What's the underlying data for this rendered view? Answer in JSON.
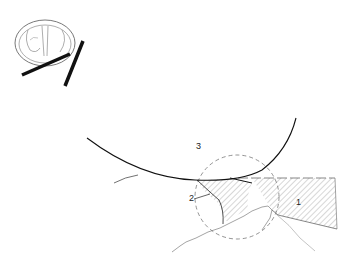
{
  "figure": {
    "inset": {
      "description": "cross-section orientation sketch with two bars indicating cut planes"
    },
    "labels": [
      {
        "id": "1",
        "text": "1",
        "x": 296,
        "y": 205
      },
      {
        "id": "2",
        "text": "2",
        "x": 199,
        "y": 200
      },
      {
        "id": "3",
        "text": "3",
        "x": 196,
        "y": 149
      }
    ],
    "colors": {
      "line": "#111111",
      "thin_line": "#444444",
      "hatch": "#888888",
      "dashed_circle": "#666666"
    }
  }
}
